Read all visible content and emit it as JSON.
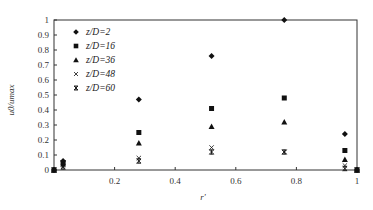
{
  "chart_data": {
    "type": "scatter",
    "title": "",
    "xlabel": "r'",
    "ylabel": "u0/umax",
    "xlim": [
      0,
      1
    ],
    "ylim": [
      0,
      1
    ],
    "grid": false,
    "legend_position": "upper-left-inside",
    "x_ticks": [
      "0.2",
      "0.4",
      "0.6",
      "0.8",
      "1"
    ],
    "y_ticks": [
      "0",
      "0.1",
      "0.2",
      "0.3",
      "0.4",
      "0.5",
      "0.6",
      "0.7",
      "0.8",
      "0.9",
      "1"
    ],
    "series": [
      {
        "name": "z/D=2",
        "marker": "diamond",
        "points": [
          [
            0,
            0
          ],
          [
            0.03,
            0.06
          ],
          [
            0.28,
            0.47
          ],
          [
            0.52,
            0.76
          ],
          [
            0.76,
            1.0
          ],
          [
            0.96,
            0.24
          ],
          [
            1,
            0
          ]
        ]
      },
      {
        "name": "z/D=16",
        "marker": "square",
        "points": [
          [
            0,
            0
          ],
          [
            0.03,
            0.05
          ],
          [
            0.28,
            0.25
          ],
          [
            0.52,
            0.41
          ],
          [
            0.76,
            0.48
          ],
          [
            0.96,
            0.13
          ],
          [
            1,
            0
          ]
        ]
      },
      {
        "name": "z/D=36",
        "marker": "triangle",
        "points": [
          [
            0,
            0
          ],
          [
            0.03,
            0.04
          ],
          [
            0.28,
            0.18
          ],
          [
            0.52,
            0.29
          ],
          [
            0.76,
            0.32
          ],
          [
            0.96,
            0.07
          ],
          [
            1,
            0
          ]
        ]
      },
      {
        "name": "z/D=48",
        "marker": "x",
        "points": [
          [
            0,
            0
          ],
          [
            0.03,
            0.03
          ],
          [
            0.28,
            0.08
          ],
          [
            0.52,
            0.15
          ],
          [
            0.76,
            0.12
          ],
          [
            0.96,
            0.03
          ],
          [
            1,
            0
          ]
        ]
      },
      {
        "name": "z/D=60",
        "marker": "asterisk",
        "points": [
          [
            0,
            0
          ],
          [
            0.03,
            0.02
          ],
          [
            0.28,
            0.06
          ],
          [
            0.52,
            0.12
          ],
          [
            0.76,
            0.12
          ],
          [
            0.96,
            0.01
          ],
          [
            1,
            0
          ]
        ]
      }
    ]
  },
  "legend": {
    "items": [
      {
        "label": "z/D=2",
        "marker": "◆"
      },
      {
        "label": "z/D=16",
        "marker": "■"
      },
      {
        "label": "z/D=36",
        "marker": "▲"
      },
      {
        "label": "z/D=48",
        "marker": "×"
      },
      {
        "label": "z/D=60",
        "marker": "✱"
      }
    ]
  },
  "axes": {
    "x_label": "r'",
    "y_label": "u0/umax"
  },
  "colors": {
    "marker": "#111111",
    "axis": "#333333"
  }
}
